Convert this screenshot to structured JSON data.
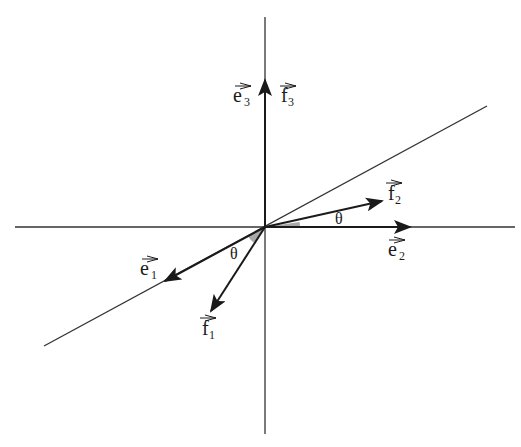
{
  "diagram": {
    "colors": {
      "ink": "#1a1a1a",
      "angle_fill": "#a8a8a8",
      "background": "#ffffff"
    },
    "origin": [
      265,
      227
    ],
    "axes": {
      "horizontal": {
        "x1": 15,
        "y1": 227,
        "x2": 515,
        "y2": 227
      },
      "vertical": {
        "x1": 265,
        "y1": 17,
        "x2": 265,
        "y2": 434
      },
      "diagonal": {
        "x1": 44,
        "y1": 346,
        "x2": 487,
        "y2": 106
      }
    },
    "vectors": [
      {
        "id": "e1",
        "name": "e",
        "sub": "1",
        "tip": [
          165,
          281
        ],
        "label_pos": [
          145,
          268
        ]
      },
      {
        "id": "e2",
        "name": "e",
        "sub": "2",
        "tip": [
          410,
          227
        ],
        "label_pos": [
          390,
          253
        ]
      },
      {
        "id": "e3",
        "name": "e",
        "sub": "3",
        "tip": [
          265,
          80
        ],
        "label_pos": [
          233,
          102
        ]
      },
      {
        "id": "f1",
        "name": "f",
        "sub": "1",
        "tip": [
          211,
          311
        ],
        "label_pos": [
          202,
          333
        ]
      },
      {
        "id": "f2",
        "name": "f",
        "sub": "2",
        "tip": [
          382,
          201
        ],
        "label_pos": [
          386,
          197
        ]
      },
      {
        "id": "f3",
        "name": "f",
        "sub": "3",
        "tip": [
          265,
          80
        ],
        "label_pos": [
          278,
          102
        ]
      }
    ],
    "angles": [
      {
        "id": "theta-right",
        "symbol": "θ",
        "label_pos": [
          340,
          223
        ]
      },
      {
        "id": "theta-left",
        "symbol": "θ",
        "label_pos": [
          233,
          258
        ]
      }
    ]
  }
}
